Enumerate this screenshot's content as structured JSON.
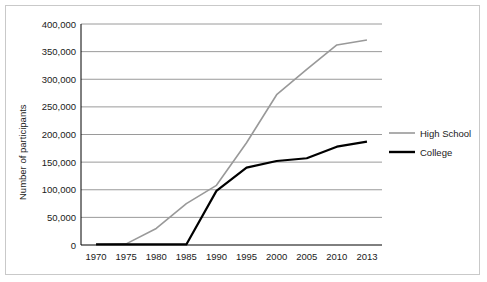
{
  "chart_data": {
    "type": "line",
    "title": "",
    "xlabel": "",
    "ylabel": "Number of participants",
    "categories": [
      "1970",
      "1975",
      "1980",
      "1985",
      "1990",
      "1995",
      "2000",
      "2005",
      "2010",
      "2013"
    ],
    "ylim": [
      0,
      400000
    ],
    "ytick_labels": [
      "0",
      "50,000",
      "100,000",
      "150,000",
      "200,000",
      "250,000",
      "300,000",
      "350,000",
      "400,000"
    ],
    "ytick_values": [
      0,
      50000,
      100000,
      150000,
      200000,
      250000,
      300000,
      350000,
      400000
    ],
    "grid": true,
    "legend_position": "right",
    "series": [
      {
        "name": "High School",
        "color": "#999999",
        "values": [
          1000,
          2000,
          30000,
          75000,
          108000,
          185000,
          272000,
          318000,
          362000,
          371000
        ]
      },
      {
        "name": "College",
        "color": "#000000",
        "values": [
          1000,
          1000,
          1000,
          1000,
          98000,
          140000,
          152000,
          157000,
          178000,
          187000
        ]
      }
    ]
  },
  "legend": {
    "items": [
      {
        "label": "High School"
      },
      {
        "label": "College"
      }
    ]
  },
  "axis": {
    "y_title": "Number of participants"
  }
}
